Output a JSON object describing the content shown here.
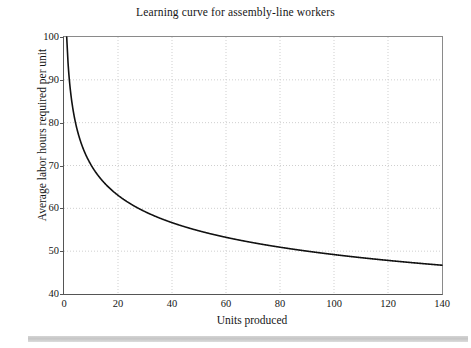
{
  "figure": {
    "title": "Learning curve for assembly-line workers",
    "footer_rule": "decorative-gray-rule"
  },
  "chart_data": {
    "type": "line",
    "title": "Learning curve for assembly-line workers",
    "xlabel": "Units produced",
    "ylabel": "Average labor hours required per unit",
    "xlim": [
      0,
      140
    ],
    "ylim": [
      40,
      100
    ],
    "xticks": [
      0,
      20,
      40,
      60,
      80,
      100,
      120,
      140
    ],
    "yticks": [
      40,
      50,
      60,
      70,
      80,
      90,
      100
    ],
    "grid": true,
    "grid_style": "dotted",
    "grid_color": "#cfcfcf",
    "legend": null,
    "line_color": "#111111",
    "line_width": 1.5,
    "model": "y = 100 * x^(-0.154)",
    "x": [
      1.5,
      2,
      3,
      4,
      5,
      6,
      8,
      10,
      12,
      15,
      20,
      25,
      30,
      35,
      40,
      50,
      60,
      70,
      80,
      90,
      100,
      110,
      120,
      130,
      140
    ],
    "y": [
      94.0,
      89.9,
      84.4,
      80.8,
      78.1,
      76.0,
      72.8,
      70.2,
      68.2,
      65.9,
      63.1,
      60.9,
      59.2,
      57.9,
      56.7,
      54.8,
      53.4,
      52.3,
      51.4,
      50.6,
      49.9,
      49.3,
      48.7,
      48.2,
      47.8
    ],
    "annotations": []
  },
  "axes": {
    "y_tick_labels": [
      "100",
      "90",
      "80",
      "70",
      "60",
      "50",
      "40"
    ],
    "x_tick_labels": [
      "0",
      "20",
      "40",
      "60",
      "80",
      "100",
      "120",
      "140"
    ],
    "x_title": "Units produced",
    "y_title": "Average labor hours required per unit"
  }
}
